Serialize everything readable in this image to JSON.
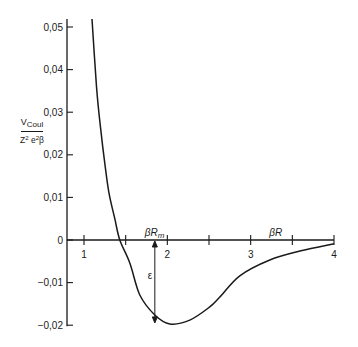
{
  "chart_data": {
    "type": "line",
    "title": "",
    "xlabel": "βR",
    "ylabel": "V_Coul / (Z² e² β)",
    "ylabel_parts": {
      "numerator": "V",
      "numerator_sub": "Coul",
      "denominator": "Z² e² β"
    },
    "xlim": [
      0.8,
      4.0
    ],
    "ylim": [
      -0.02,
      0.05
    ],
    "x_ticks_major": [
      1,
      2,
      3,
      4
    ],
    "x_ticks_minor": [
      1.5,
      2.5,
      3.5
    ],
    "x_tick_labels": [
      "1",
      "2",
      "3",
      "4"
    ],
    "y_ticks": [
      0.05,
      0.04,
      0.03,
      0.02,
      0.01,
      0,
      -0.01,
      -0.02
    ],
    "y_tick_labels": [
      "0,05",
      "0,04",
      "0,03",
      "0,02",
      "0,01",
      "0",
      "−0,01",
      "−0,02"
    ],
    "grid": false,
    "legend": null,
    "series": [
      {
        "name": "V_Coul / (Z² e² β)",
        "x": [
          1.1,
          1.15,
          1.2,
          1.25,
          1.3,
          1.37,
          1.43,
          1.55,
          1.67,
          1.85,
          2.03,
          2.27,
          2.51,
          2.63,
          2.87,
          3.23,
          3.59,
          4.0
        ],
        "y": [
          0.05,
          0.036,
          0.026,
          0.018,
          0.011,
          0.005,
          0.0,
          -0.0054,
          -0.0129,
          -0.0176,
          -0.0197,
          -0.0188,
          -0.0157,
          -0.0134,
          -0.0084,
          -0.0047,
          -0.0026,
          -0.0009
        ]
      }
    ],
    "annotations": [
      {
        "text": "βR_m",
        "x": 1.85,
        "y": 0,
        "note": "position of minimum on x-axis"
      },
      {
        "text": "βR",
        "x": 3.2,
        "y": 0,
        "note": "x-axis label"
      },
      {
        "text": "ε",
        "x": 1.85,
        "y_from": 0,
        "y_to": -0.0197,
        "note": "double-headed arrow, well depth"
      }
    ]
  },
  "labels": {
    "y_num": "V",
    "y_num_sub": "Coul",
    "y_den_z": "Z",
    "y_den_e": "e",
    "y_den_beta": "β",
    "y_den_sup": "2",
    "x_axis": "βR",
    "rm_label_main": "βR",
    "rm_label_sub": "m",
    "epsilon": "ε"
  }
}
